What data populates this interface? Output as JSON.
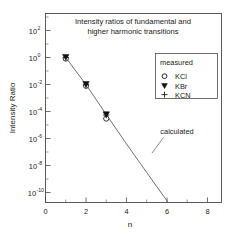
{
  "chart_data": {
    "type": "scatter",
    "title": "Intensity ratios of fundamental and higher harmonic transitions",
    "title_line1": "Intensity ratios of fundamental and",
    "title_line2": "higher harmonic transitions",
    "xlabel": "n",
    "ylabel": "Intensity Ratio",
    "xscale": "linear",
    "yscale": "log",
    "xlim": [
      0,
      8.7
    ],
    "ylim": [
      1e-11,
      1000
    ],
    "grid": false,
    "xticks": [
      0,
      2,
      4,
      6,
      8
    ],
    "xticklabels": [
      "0",
      "2",
      "4",
      "6",
      "8"
    ],
    "yticks": [
      100,
      1,
      0.01,
      0.0001,
      1e-06,
      1e-08,
      1e-10
    ],
    "yticklabels": [
      {
        "base": "10",
        "exp": "2"
      },
      {
        "base": "10",
        "exp": "0"
      },
      {
        "base": "10",
        "exp": "-2"
      },
      {
        "base": "10",
        "exp": "-4"
      },
      {
        "base": "10",
        "exp": "-6"
      },
      {
        "base": "10",
        "exp": "-8"
      },
      {
        "base": "10",
        "exp": "-10"
      }
    ],
    "legend": {
      "position": "upper right",
      "header": "measured",
      "entries": [
        {
          "marker": "open-circle",
          "label": "KCl"
        },
        {
          "marker": "filled-down-triangle",
          "label": "KBr"
        },
        {
          "marker": "plus",
          "label": "KCN"
        }
      ]
    },
    "annotations": [
      {
        "text": "calculated",
        "x": 5.6,
        "y": 1e-06
      }
    ],
    "series": [
      {
        "name": "KCl",
        "marker": "open-circle",
        "x": [
          1,
          2,
          3
        ],
        "y": [
          1.0,
          0.0095,
          3e-05
        ]
      },
      {
        "name": "KBr",
        "marker": "filled-down-triangle",
        "x": [
          1,
          2,
          3
        ],
        "y": [
          1.0,
          0.01,
          7e-05
        ]
      },
      {
        "name": "KCN",
        "marker": "plus",
        "x": [
          1,
          2,
          3
        ],
        "y": [
          1.0,
          0.01,
          5.5e-05
        ]
      },
      {
        "name": "calculated",
        "type": "line",
        "x": [
          1,
          2,
          3,
          4,
          5,
          6,
          7,
          8.2
        ],
        "y": [
          1.0,
          0.0098,
          6e-05,
          4e-07,
          3e-09,
          2.4e-11,
          2e-13,
          1e-15
        ]
      }
    ],
    "colors": {
      "axis": "#4a4a4a",
      "curve": "#555555",
      "marker_fill": "#111111",
      "marker_open": "#ffffff",
      "text": "#1a1a1a",
      "background": "#ffffff"
    }
  }
}
